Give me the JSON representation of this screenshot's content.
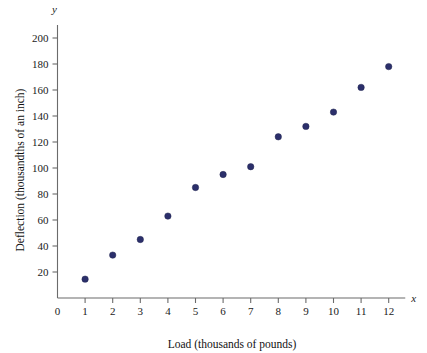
{
  "chart_data": {
    "type": "scatter",
    "title": "",
    "xlabel": "Load (thousands of pounds)",
    "ylabel": "Deflection (thousandths of an inch)",
    "x_var_symbol": "x",
    "y_var_symbol": "y",
    "xlim": [
      0,
      12.6
    ],
    "ylim": [
      0,
      210
    ],
    "x_ticks": [
      0,
      1,
      2,
      3,
      4,
      5,
      6,
      7,
      8,
      9,
      10,
      11,
      12
    ],
    "x_tick_labels": [
      "0",
      "1",
      "2",
      "3",
      "4",
      "5",
      "6",
      "7",
      "8",
      "9",
      "10",
      "11",
      "12"
    ],
    "y_ticks": [
      20,
      40,
      60,
      80,
      100,
      120,
      140,
      160,
      180,
      200
    ],
    "y_tick_labels": [
      "20",
      "40",
      "60",
      "80",
      "100",
      "120",
      "140",
      "160",
      "180",
      "200"
    ],
    "grid": false,
    "legend": null,
    "series": [
      {
        "name": "Deflection vs Load",
        "marker": "circle",
        "color": "#2b2f6b",
        "points": [
          {
            "x": 1,
            "y": 14.5
          },
          {
            "x": 2,
            "y": 33
          },
          {
            "x": 3,
            "y": 45
          },
          {
            "x": 4,
            "y": 63
          },
          {
            "x": 5,
            "y": 85
          },
          {
            "x": 6,
            "y": 95
          },
          {
            "x": 7,
            "y": 101
          },
          {
            "x": 8,
            "y": 124
          },
          {
            "x": 9,
            "y": 132
          },
          {
            "x": 10,
            "y": 143
          },
          {
            "x": 11,
            "y": 162
          },
          {
            "x": 12,
            "y": 178
          }
        ]
      }
    ]
  },
  "colors": {
    "marker": "#2b2f6b",
    "axis": "#6b6b6b",
    "text": "#111111",
    "background": "#ffffff"
  }
}
